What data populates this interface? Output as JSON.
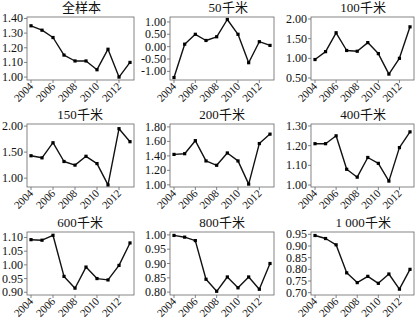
{
  "figure": {
    "years": [
      2004,
      2005,
      2006,
      2007,
      2008,
      2009,
      2010,
      2011,
      2012,
      2013
    ],
    "x_tick_labels": [
      "2004",
      "2006",
      "2008",
      "2010",
      "2012"
    ],
    "line_color": "#111111",
    "marker_color": "#000000",
    "axis_color": "#666666"
  },
  "chart_data": [
    {
      "type": "line",
      "title": "全样本",
      "x": [
        2004,
        2005,
        2006,
        2007,
        2008,
        2009,
        2010,
        2011,
        2012,
        2013
      ],
      "values": [
        1.35,
        1.32,
        1.27,
        1.15,
        1.11,
        1.11,
        1.05,
        1.19,
        1.0,
        1.1
      ],
      "yticks": [
        1.0,
        1.1,
        1.2,
        1.3,
        1.4
      ],
      "ytick_labels": [
        "1.00",
        "1.10",
        "1.20",
        "1.30",
        "1.40"
      ],
      "ylim": [
        0.98,
        1.41
      ],
      "grid": false,
      "xlabel": "",
      "ylabel": ""
    },
    {
      "type": "line",
      "title": "50千米",
      "x": [
        2004,
        2005,
        2006,
        2007,
        2008,
        2009,
        2010,
        2011,
        2012,
        2013
      ],
      "values": [
        -1.25,
        0.1,
        0.5,
        0.25,
        0.4,
        1.1,
        0.5,
        -0.65,
        0.2,
        0.05
      ],
      "yticks": [
        -1.0,
        -0.5,
        0.0,
        0.5,
        1.0
      ],
      "ytick_labels": [
        "-1.00",
        "-0.50",
        "0.00",
        "0.50",
        "1.00"
      ],
      "ylim": [
        -1.35,
        1.2
      ],
      "grid": false,
      "xlabel": "",
      "ylabel": ""
    },
    {
      "type": "line",
      "title": "100千米",
      "x": [
        2004,
        2005,
        2006,
        2007,
        2008,
        2009,
        2010,
        2011,
        2012,
        2013
      ],
      "values": [
        0.97,
        1.17,
        1.65,
        1.2,
        1.18,
        1.4,
        1.12,
        0.6,
        1.0,
        1.8
      ],
      "yticks": [
        0.5,
        1.0,
        1.5,
        2.0
      ],
      "ytick_labels": [
        "0.50",
        "1.00",
        "1.50",
        "2.00"
      ],
      "ylim": [
        0.45,
        2.05
      ],
      "grid": false,
      "xlabel": "",
      "ylabel": ""
    },
    {
      "type": "line",
      "title": "150千米",
      "x": [
        2004,
        2005,
        2006,
        2007,
        2008,
        2009,
        2010,
        2011,
        2012,
        2013
      ],
      "values": [
        1.43,
        1.39,
        1.68,
        1.32,
        1.25,
        1.42,
        1.28,
        0.87,
        1.95,
        1.7
      ],
      "yticks": [
        1.0,
        1.5,
        2.0
      ],
      "ytick_labels": [
        "1.00",
        "1.50",
        "2.00"
      ],
      "ylim": [
        0.83,
        2.04
      ],
      "grid": false,
      "xlabel": "",
      "ylabel": ""
    },
    {
      "type": "line",
      "title": "200千米",
      "x": [
        2004,
        2005,
        2006,
        2007,
        2008,
        2009,
        2010,
        2011,
        2012,
        2013
      ],
      "values": [
        1.42,
        1.43,
        1.61,
        1.33,
        1.27,
        1.44,
        1.33,
        1.01,
        1.57,
        1.7
      ],
      "yticks": [
        1.0,
        1.2,
        1.4,
        1.6,
        1.8
      ],
      "ytick_labels": [
        "1.00",
        "1.20",
        "1.40",
        "1.60",
        "1.80"
      ],
      "ylim": [
        0.97,
        1.84
      ],
      "grid": false,
      "xlabel": "",
      "ylabel": ""
    },
    {
      "type": "line",
      "title": "400千米",
      "x": [
        2004,
        2005,
        2006,
        2007,
        2008,
        2009,
        2010,
        2011,
        2012,
        2013
      ],
      "values": [
        1.21,
        1.21,
        1.25,
        1.08,
        1.04,
        1.14,
        1.11,
        1.02,
        1.19,
        1.27
      ],
      "yticks": [
        1.0,
        1.1,
        1.2,
        1.3
      ],
      "ytick_labels": [
        "1.00",
        "1.10",
        "1.20",
        "1.30"
      ],
      "ylim": [
        0.99,
        1.31
      ],
      "grid": false,
      "xlabel": "",
      "ylabel": ""
    },
    {
      "type": "line",
      "title": "600千米",
      "x": [
        2004,
        2005,
        2006,
        2007,
        2008,
        2009,
        2010,
        2011,
        2012,
        2013
      ],
      "values": [
        1.092,
        1.09,
        1.108,
        0.958,
        0.915,
        0.992,
        0.95,
        0.945,
        0.998,
        1.08
      ],
      "yticks": [
        0.9,
        0.95,
        1.0,
        1.05,
        1.1
      ],
      "ytick_labels": [
        "0.90",
        "0.95",
        "1.00",
        "1.05",
        "1.10"
      ],
      "ylim": [
        0.89,
        1.12
      ],
      "grid": false,
      "xlabel": "",
      "ylabel": ""
    },
    {
      "type": "line",
      "title": "800千米",
      "x": [
        2004,
        2005,
        2006,
        2007,
        2008,
        2009,
        2010,
        2011,
        2012,
        2013
      ],
      "values": [
        0.998,
        0.992,
        0.98,
        0.845,
        0.803,
        0.853,
        0.815,
        0.853,
        0.81,
        0.9
      ],
      "yticks": [
        0.8,
        0.85,
        0.9,
        0.95,
        1.0
      ],
      "ytick_labels": [
        "0.80",
        "0.85",
        "0.90",
        "0.95",
        "1.00"
      ],
      "ylim": [
        0.79,
        1.01
      ],
      "grid": false,
      "xlabel": "",
      "ylabel": ""
    },
    {
      "type": "line",
      "title": "1 000千米",
      "x": [
        2004,
        2005,
        2006,
        2007,
        2008,
        2009,
        2010,
        2011,
        2012,
        2013
      ],
      "values": [
        0.945,
        0.932,
        0.905,
        0.785,
        0.743,
        0.77,
        0.74,
        0.78,
        0.715,
        0.8
      ],
      "yticks": [
        0.7,
        0.75,
        0.8,
        0.85,
        0.9,
        0.95
      ],
      "ytick_labels": [
        "0.70",
        "0.75",
        "0.80",
        "0.85",
        "0.90",
        "0.95"
      ],
      "ylim": [
        0.69,
        0.96
      ],
      "grid": false,
      "xlabel": "",
      "ylabel": ""
    }
  ]
}
